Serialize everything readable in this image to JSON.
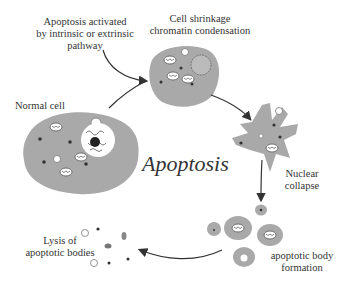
{
  "diagram": {
    "title": "Apoptosis",
    "stages": [
      {
        "id": "activation",
        "label_lines": [
          "Apoptosis activated",
          "by intrinsic or extrinsic",
          "pathway"
        ]
      },
      {
        "id": "normal",
        "label_lines": [
          "Normal cell"
        ]
      },
      {
        "id": "shrinkage",
        "label_lines": [
          "Cell shrinkage",
          "chromatin condensation"
        ]
      },
      {
        "id": "collapse",
        "label_lines": [
          "Nuclear",
          "collapse"
        ]
      },
      {
        "id": "bodies",
        "label_lines": [
          "apoptotic body",
          "formation"
        ]
      },
      {
        "id": "lysis",
        "label_lines": [
          "Lysis of",
          "apoptotic bodies"
        ]
      }
    ],
    "colors": {
      "cell_fill": "#a9a9a9",
      "organelle_fill": "#ffffff",
      "dot": "#333333",
      "arrow": "#333333"
    }
  }
}
